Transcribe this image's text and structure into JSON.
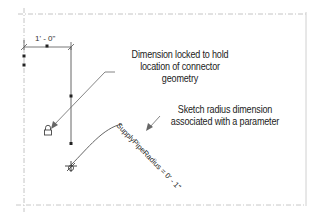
{
  "diagram": {
    "dimension": {
      "label": "1' - 0\""
    },
    "parameter_dimension": {
      "label": "SupplyPipeRadius = 0' - 1\""
    },
    "callouts": {
      "locked": {
        "lines": [
          "Dimension locked to hold",
          "location of connector",
          "geometry"
        ]
      },
      "radius": {
        "lines": [
          "Sketch radius dimension",
          "associated with a parameter"
        ]
      }
    },
    "icons": [
      "lock-icon",
      "connector-origin-icon"
    ],
    "colors": {
      "line": "#555555",
      "reference_line": "#bbbbbb",
      "border": "#d0d0d0",
      "text": "#222222"
    }
  }
}
